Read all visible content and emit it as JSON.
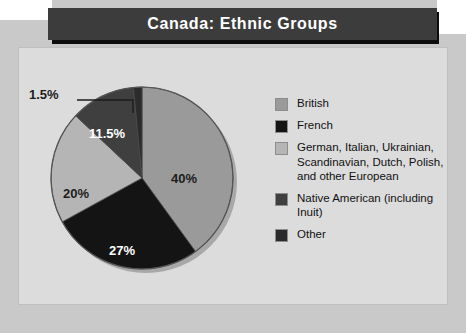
{
  "title": "Canada: Ethnic Groups",
  "colors": {
    "page_background": "#c9c9c9",
    "panel_background": "#dcdcdc",
    "banner_background": "#3c3c3c",
    "banner_text": "#ffffff",
    "british": "#9a9a9a",
    "french": "#141414",
    "european": "#b5b5b5",
    "native_american": "#3f3f3f",
    "other": "#2b2b2b"
  },
  "chart_data": {
    "type": "pie",
    "title": "Canada: Ethnic Groups",
    "xlabel": "",
    "ylabel": "",
    "legend_position": "right",
    "grid": false,
    "start_angle_deg": 0,
    "direction": "clockwise",
    "categories": [
      "British",
      "French",
      "German, Italian, Ukrainian, Scandinavian, Dutch, Polish, and other European",
      "Native American (including Inuit)",
      "Other"
    ],
    "values": [
      40,
      27,
      20,
      11.5,
      1.5
    ],
    "value_labels": [
      "40%",
      "27%",
      "20%",
      "11.5%",
      "1.5%"
    ],
    "slice_colors": [
      "#9a9a9a",
      "#141414",
      "#b5b5b5",
      "#3f3f3f",
      "#2b2b2b"
    ],
    "slices": [
      {
        "label": "British",
        "value": 40,
        "display": "40%",
        "color": "#9a9a9a",
        "label_color": "#1d1d1d"
      },
      {
        "label": "French",
        "value": 27,
        "display": "27%",
        "color": "#141414",
        "label_color": "#ffffff"
      },
      {
        "label": "European",
        "value": 20,
        "display": "20%",
        "color": "#b5b5b5",
        "label_color": "#1d1d1d"
      },
      {
        "label": "Native American",
        "value": 11.5,
        "display": "11.5%",
        "color": "#3f3f3f",
        "label_color": "#ffffff"
      },
      {
        "label": "Other",
        "value": 1.5,
        "display": "1.5%",
        "color": "#2b2b2b",
        "label_color": "#1d1d1d"
      }
    ]
  },
  "legend": {
    "items": [
      {
        "label": "British",
        "color": "#9a9a9a"
      },
      {
        "label": "French",
        "color": "#141414"
      },
      {
        "label": "German, Italian, Ukrainian, Scandinavian, Dutch, Polish, and other European",
        "color": "#b5b5b5"
      },
      {
        "label": "Native American (including Inuit)",
        "color": "#3f3f3f"
      },
      {
        "label": "Other",
        "color": "#2b2b2b"
      }
    ]
  }
}
